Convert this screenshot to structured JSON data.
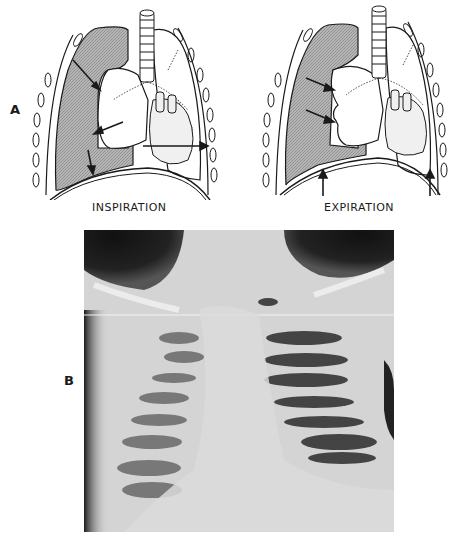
{
  "figure": {
    "panel_a": {
      "label": "A",
      "left_caption": "INSPIRATION",
      "right_caption": "EXPIRATION"
    },
    "panel_b": {
      "label": "B"
    }
  },
  "colors": {
    "pleural_shading": "#9a9a9a",
    "line": "#1a1a1a",
    "xray_dark": "#1c1c1c",
    "xray_light": "#dcdcdc"
  }
}
